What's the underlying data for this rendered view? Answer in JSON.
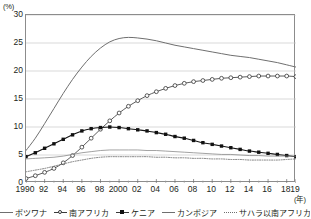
{
  "axes": {
    "y_unit": "(%)",
    "x_unit": "(年)",
    "y_ticks": [
      "0",
      "5",
      "10",
      "15",
      "20",
      "25",
      "30"
    ],
    "x_ticks": [
      "1990",
      "92",
      "94",
      "96",
      "98",
      "2000",
      "02",
      "04",
      "06",
      "08",
      "10",
      "12",
      "14",
      "16",
      "18",
      "19"
    ]
  },
  "legend": {
    "items": [
      {
        "label": "ボツワナ",
        "style": "plain-line"
      },
      {
        "label": "南アフリカ",
        "style": "open-circle"
      },
      {
        "label": "ケニア",
        "style": "filled-square"
      },
      {
        "label": "カンボジア",
        "style": "thin-line"
      },
      {
        "label": "サハラ以南アフリカ",
        "style": "dotted-line"
      }
    ]
  },
  "chart_data": {
    "type": "line",
    "title": "",
    "xlabel": "(年)",
    "ylabel": "(%)",
    "xlim": [
      1990,
      2019
    ],
    "ylim": [
      0,
      30
    ],
    "grid": true,
    "legend_position": "bottom",
    "x": [
      1990,
      1991,
      1992,
      1993,
      1994,
      1995,
      1996,
      1997,
      1998,
      1999,
      2000,
      2001,
      2002,
      2003,
      2004,
      2005,
      2006,
      2007,
      2008,
      2009,
      2010,
      2011,
      2012,
      2013,
      2014,
      2015,
      2016,
      2017,
      2018,
      2019
    ],
    "series": [
      {
        "name": "ボツワナ",
        "style": "plain-line",
        "values": [
          5.8,
          8.0,
          10.6,
          13.3,
          16.0,
          18.5,
          20.7,
          22.6,
          24.1,
          25.2,
          25.8,
          26.0,
          25.9,
          25.7,
          25.4,
          25.0,
          24.6,
          24.3,
          24.0,
          23.7,
          23.4,
          23.1,
          22.8,
          22.6,
          22.4,
          22.1,
          21.8,
          21.5,
          21.1,
          20.7
        ]
      },
      {
        "name": "南アフリカ",
        "style": "open-circle",
        "values": [
          0.8,
          1.3,
          1.9,
          2.6,
          3.6,
          4.9,
          6.4,
          8.0,
          9.6,
          11.1,
          12.5,
          13.7,
          14.7,
          15.6,
          16.3,
          16.9,
          17.4,
          17.8,
          18.1,
          18.3,
          18.5,
          18.7,
          18.8,
          18.9,
          19.0,
          19.1,
          19.1,
          19.1,
          19.1,
          19.0
        ]
      },
      {
        "name": "ケニア",
        "style": "filled-square",
        "values": [
          4.7,
          5.4,
          6.2,
          7.0,
          7.8,
          8.6,
          9.3,
          9.7,
          9.9,
          10.0,
          9.9,
          9.7,
          9.5,
          9.3,
          9.0,
          8.7,
          8.3,
          8.0,
          7.6,
          7.2,
          6.9,
          6.6,
          6.3,
          6.0,
          5.7,
          5.5,
          5.3,
          5.1,
          4.9,
          4.7
        ]
      },
      {
        "name": "カンボジア",
        "style": "thin-line",
        "values": [
          4.3,
          4.4,
          4.5,
          4.6,
          4.8,
          5.1,
          5.4,
          5.6,
          5.8,
          5.9,
          5.9,
          5.9,
          5.9,
          5.8,
          5.8,
          5.7,
          5.6,
          5.5,
          5.4,
          5.3,
          5.2,
          5.1,
          5.1,
          5.0,
          4.9,
          4.9,
          4.8,
          4.8,
          4.8,
          4.8
        ]
      },
      {
        "name": "サハラ以南アフリカ",
        "style": "dotted-line",
        "values": [
          2.0,
          2.3,
          2.6,
          3.0,
          3.4,
          3.8,
          4.1,
          4.4,
          4.6,
          4.7,
          4.7,
          4.7,
          4.7,
          4.7,
          4.6,
          4.6,
          4.5,
          4.5,
          4.4,
          4.4,
          4.3,
          4.3,
          4.2,
          4.2,
          4.1,
          4.1,
          4.1,
          4.1,
          4.2,
          4.3
        ]
      }
    ]
  }
}
